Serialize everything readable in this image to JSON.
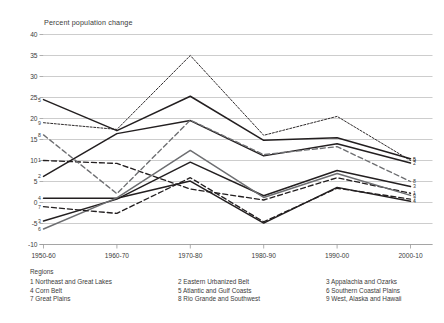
{
  "chart_data": {
    "type": "line",
    "title": "",
    "ylabel": "Percent population change",
    "xlabel": "",
    "categories": [
      "1950-60",
      "1960-70",
      "1970-80",
      "1980-90",
      "1990-00",
      "2000-10"
    ],
    "ylim": [
      -10,
      40
    ],
    "yticks": [
      -10,
      -5,
      0,
      5,
      10,
      15,
      20,
      25,
      30,
      35,
      40
    ],
    "ytick_labels": [
      "-10",
      "-5",
      "0",
      "5",
      "10",
      "15",
      "20",
      "25",
      "30",
      "35",
      "40"
    ],
    "grid": true,
    "legend_position": "below",
    "series": [
      {
        "name": "1",
        "label": "1 Northeast and Great Lakes",
        "style": "dashed",
        "color": "#231f20",
        "values": [
          10.0,
          9.3,
          3.2,
          0.6,
          5.9,
          2.2
        ]
      },
      {
        "name": "2",
        "label": "2 Eastern Urbanized Belt",
        "style": "solid",
        "color": "#231f20",
        "values": [
          6.2,
          16.4,
          19.5,
          11.1,
          14.0,
          9.4
        ]
      },
      {
        "name": "3",
        "label": "3 Appalachia and Ozarks",
        "style": "solid",
        "color": "#231f20",
        "values": [
          -4.4,
          0.8,
          9.6,
          1.6,
          7.6,
          3.8
        ]
      },
      {
        "name": "4",
        "label": "4 Corn Belt",
        "style": "solid",
        "color": "#231f20",
        "values": [
          1.0,
          1.0,
          5.1,
          -4.9,
          3.6,
          0.3
        ]
      },
      {
        "name": "5",
        "label": "5 Atlantic and Gulf Coasts",
        "style": "solid",
        "color": "#231f20",
        "values": [
          24.5,
          17.1,
          25.3,
          14.8,
          15.4,
          10.4
        ]
      },
      {
        "name": "6",
        "label": "6 Southern Coastal Plains",
        "style": "solid",
        "color": "#6d6e71",
        "values": [
          -6.3,
          1.1,
          12.4,
          1.2,
          6.9,
          1.7
        ]
      },
      {
        "name": "7",
        "label": "7 Great Plains",
        "style": "dashed",
        "color": "#231f20",
        "values": [
          -1.0,
          -2.6,
          5.9,
          -4.6,
          3.4,
          0.8
        ]
      },
      {
        "name": "8",
        "label": "8 Rio Grande and Southwest",
        "style": "dashed",
        "color": "#6d6e71",
        "values": [
          16.1,
          2.1,
          19.6,
          11.4,
          13.3,
          5.0
        ]
      },
      {
        "name": "9",
        "label": "9 West, Alaska and Hawaii",
        "style": "dotted",
        "color": "#231f20",
        "values": [
          19.0,
          17.4,
          35.0,
          16.0,
          20.5,
          10.0
        ]
      }
    ],
    "left_tags": [
      "5",
      "9",
      "8",
      "1",
      "2",
      "4",
      "7",
      "3",
      "6"
    ],
    "right_tags": [
      "5",
      "9",
      "2",
      "8",
      "3",
      "1",
      "6",
      "7",
      "4"
    ]
  },
  "legend": {
    "title": "Regions",
    "items": [
      "1 Northeast and Great Lakes",
      "2 Eastern Urbanized Belt",
      "3 Appalachia and Ozarks",
      "4 Corn Belt",
      "5 Atlantic and Gulf Coasts",
      "6 Southern Coastal Plains",
      "7 Great Plains",
      "8 Rio Grande and Southwest",
      "9 West, Alaska and Hawaii"
    ]
  }
}
